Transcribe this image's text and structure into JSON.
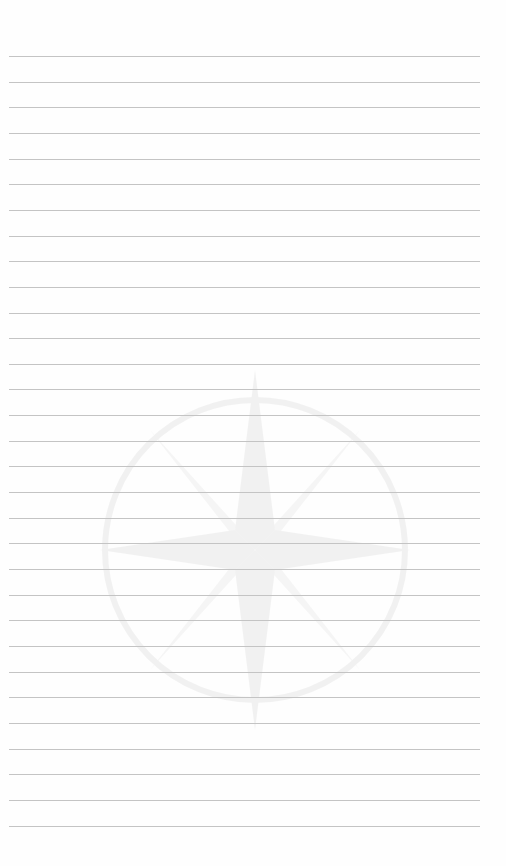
{
  "page": {
    "type": "lined-notebook-page",
    "background_color": "#fefefe",
    "line_color": "#c4c4c4",
    "line_count": 31,
    "first_line_y": 56,
    "line_spacing": 25.65,
    "line_left": 9,
    "line_right": 480,
    "watermark": {
      "icon": "compass-star-icon",
      "center_x": 252,
      "center_y": 550
    }
  }
}
